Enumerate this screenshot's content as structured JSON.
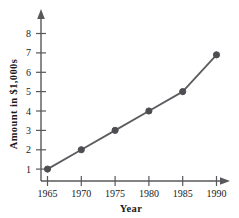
{
  "chart_data": {
    "type": "line",
    "title": "",
    "xlabel": "Year",
    "ylabel": "Amount in $1,000s",
    "x": [
      1965,
      1970,
      1975,
      1980,
      1985,
      1990
    ],
    "values": [
      1,
      2,
      3,
      4,
      5,
      6.9
    ],
    "series": [
      {
        "name": "Amount",
        "values": [
          1,
          2,
          3,
          4,
          5,
          6.9
        ]
      }
    ],
    "categories": [
      "1965",
      "1970",
      "1975",
      "1980",
      "1985",
      "1990"
    ],
    "xticklabels": [
      "1965",
      "1970",
      "1975",
      "1980",
      "1985",
      "1990"
    ],
    "yticklabels": [
      "1",
      "2",
      "3",
      "4",
      "5",
      "6",
      "7",
      "8"
    ],
    "yticks": [
      1,
      2,
      3,
      4,
      5,
      6,
      7,
      8
    ],
    "xlim": [
      1962.5,
      1992.5
    ],
    "ylim": [
      0,
      8.8
    ],
    "grid": false,
    "legend": false,
    "legend_position": "none",
    "line_color": "#5c5c60",
    "marker_color": "#4e4e52",
    "axis_color": "#58585c",
    "background_color": "#ffffff",
    "marker": "circle",
    "axis_arrows": true
  },
  "axes": {
    "x_axis_label": "Year",
    "y_axis_label": "Amount in $1,000s"
  },
  "ticks": {
    "y": [
      {
        "label": "8",
        "value": 8
      },
      {
        "label": "7",
        "value": 7
      },
      {
        "label": "6",
        "value": 6
      },
      {
        "label": "5",
        "value": 5
      },
      {
        "label": "4",
        "value": 4
      },
      {
        "label": "3",
        "value": 3
      },
      {
        "label": "2",
        "value": 2
      },
      {
        "label": "1",
        "value": 1
      }
    ],
    "x": [
      {
        "label": "1965",
        "value": 1965
      },
      {
        "label": "1970",
        "value": 1970
      },
      {
        "label": "1975",
        "value": 1975
      },
      {
        "label": "1980",
        "value": 1980
      },
      {
        "label": "1985",
        "value": 1985
      },
      {
        "label": "1990",
        "value": 1990
      }
    ]
  }
}
